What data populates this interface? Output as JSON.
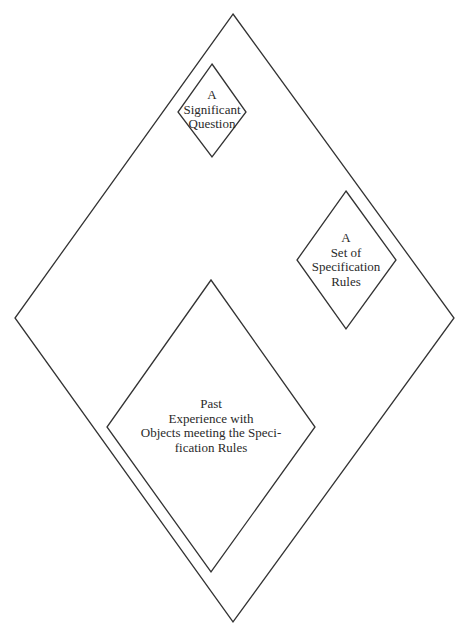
{
  "diagram": {
    "outer_diamond": {
      "points": "233,14 454,318 233,622 15,318"
    },
    "question_diamond": {
      "points": "212,64 246,112 212,157 178,112",
      "lines": [
        "A",
        "Significant",
        "Question"
      ]
    },
    "rules_diamond": {
      "points": "346,191 396,260 346,329 297,260",
      "lines": [
        "A",
        "Set of",
        "Specification",
        "Rules"
      ]
    },
    "experience_diamond": {
      "points": "211,280 315,427 211,572 107,427",
      "lines": [
        "Past",
        "Experience with",
        "Objects meeting the Speci-",
        "fication Rules"
      ]
    },
    "colors": {
      "stroke": "#333333",
      "text": "#2a2a2a",
      "background": "#ffffff"
    }
  }
}
